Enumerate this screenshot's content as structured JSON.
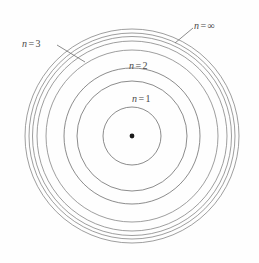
{
  "figure": {
    "kind": "bohr-model-energy-level-diagram",
    "background_color": "#fefefe",
    "line_color": "#6f6f6f",
    "nucleus_color": "#1a1a1a",
    "width": 259,
    "height": 263
  },
  "labels": {
    "n_infinity": {
      "variable": "n",
      "equals": "=",
      "value": "∞"
    },
    "n_3": {
      "variable": "n",
      "equals": "=",
      "value": "3"
    },
    "n_2": {
      "variable": "n",
      "equals": "=",
      "value": "2"
    },
    "n_1": {
      "variable": "n",
      "equals": "=",
      "value": "1"
    }
  },
  "chart_data": {
    "type": "scatter",
    "title": "",
    "xlabel": "",
    "ylabel": "",
    "center": {
      "x": 132,
      "y": 136
    },
    "nucleus_radius": 2.4,
    "orbits": [
      {
        "n": "1",
        "radius": 29,
        "labeled": true
      },
      {
        "n": "2",
        "radius": 55,
        "labeled": true
      },
      {
        "n": "3",
        "radius": 68,
        "labeled": true
      },
      {
        "n": "4",
        "radius": 86,
        "labeled": false
      },
      {
        "n": "5",
        "radius": 95,
        "labeled": false
      },
      {
        "n": "6",
        "radius": 99.5,
        "labeled": false
      },
      {
        "n": "7",
        "radius": 103,
        "labeled": false
      },
      {
        "n": "∞",
        "radius": 107,
        "labeled": true
      }
    ],
    "leaders": [
      {
        "for": "∞",
        "x1": 193,
        "y1": 28,
        "x2": 175,
        "y2": 43
      },
      {
        "for": "3",
        "x1": 57,
        "y1": 45,
        "x2": 85,
        "y2": 62
      }
    ],
    "grid": false,
    "legend": "none"
  }
}
